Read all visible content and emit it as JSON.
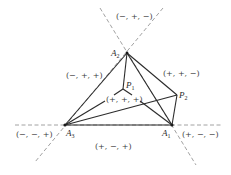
{
  "diagram": {
    "points": {
      "A1": {
        "label": "A",
        "sub": "1",
        "x": 172,
        "y": 125
      },
      "A2": {
        "label": "A",
        "sub": "2",
        "x": 127,
        "y": 53
      },
      "A3": {
        "label": "A",
        "sub": "3",
        "x": 65,
        "y": 125
      },
      "P1": {
        "label": "P",
        "sub": "1",
        "x": 123,
        "y": 89
      },
      "P2": {
        "label": "P",
        "sub": "2",
        "x": 177,
        "y": 95
      }
    },
    "regions": {
      "top": "(−, +, −)",
      "left_upper": "(−, +, +)",
      "right_upper": "(+, +, −)",
      "center": "(+, +, +)",
      "left_lower": "(−, −, +)",
      "right_lower": "(+, −, −)",
      "bottom": "(+, −, +)"
    },
    "stroke_color": "#2b2b2b",
    "dash_color": "#8a8a8a"
  }
}
